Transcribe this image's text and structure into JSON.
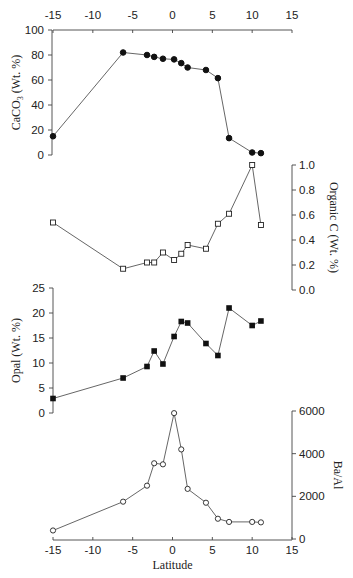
{
  "chart_data": [
    {
      "type": "line",
      "panel": "top",
      "title": "",
      "xlabel": "",
      "x_axis_position": "top",
      "xlim": [
        -15,
        15
      ],
      "x_ticks": [
        "-15",
        "-10",
        "-5",
        "0",
        "5",
        "10",
        "15"
      ],
      "ylabel": "CaCO3 (Wt. %)",
      "y_axis_side": "left",
      "ylim": [
        0,
        100
      ],
      "y_ticks": [
        "0",
        "20",
        "40",
        "60",
        "80",
        "100"
      ],
      "marker": "filled-circle",
      "x": [
        -15,
        -6.2,
        -3.2,
        -2.3,
        -1.2,
        0.2,
        1.1,
        1.9,
        4.2,
        5.7,
        7.1,
        10.0,
        11.1
      ],
      "values": [
        15,
        82,
        80,
        78.5,
        77,
        76.5,
        73.5,
        70,
        68,
        61.5,
        13.5,
        2,
        1.5
      ]
    },
    {
      "type": "line",
      "panel": "second",
      "ylabel": "Organic C (Wt. %)",
      "y_axis_side": "right",
      "ylim": [
        0.0,
        1.0
      ],
      "y_ticks": [
        "0.0",
        "0.2",
        "0.4",
        "0.6",
        "0.8",
        "1.0"
      ],
      "marker": "open-square",
      "x": [
        -15,
        -6.2,
        -3.2,
        -2.3,
        -1.2,
        0.2,
        1.1,
        1.9,
        4.2,
        5.7,
        7.1,
        10.0,
        11.1
      ],
      "values": [
        0.54,
        0.17,
        0.22,
        0.22,
        0.3,
        0.24,
        0.29,
        0.36,
        0.33,
        0.53,
        0.61,
        1.0,
        0.52
      ]
    },
    {
      "type": "line",
      "panel": "third",
      "ylabel": "Opal (Wt. %)",
      "y_axis_side": "left",
      "ylim": [
        0,
        25
      ],
      "y_ticks": [
        "0",
        "5",
        "10",
        "15",
        "20",
        "25"
      ],
      "marker": "filled-square",
      "x": [
        -15,
        -6.2,
        -3.2,
        -2.3,
        -1.2,
        0.2,
        1.1,
        1.9,
        4.2,
        5.7,
        7.1,
        10.0,
        11.1
      ],
      "values": [
        2.9,
        7.0,
        9.3,
        12.4,
        9.8,
        15.3,
        18.3,
        18.0,
        13.9,
        11.5,
        21.0,
        17.5,
        18.4
      ]
    },
    {
      "type": "line",
      "panel": "bottom",
      "xlabel": "Latitude",
      "x_axis_position": "bottom",
      "xlim": [
        -15,
        15
      ],
      "x_ticks": [
        "-15",
        "-10",
        "-5",
        "0",
        "5",
        "10",
        "15"
      ],
      "ylabel": "Ba/Al",
      "y_axis_side": "right",
      "ylim": [
        0,
        6000
      ],
      "y_ticks": [
        "0",
        "2000",
        "4000",
        "6000"
      ],
      "marker": "open-circle",
      "x": [
        -15,
        -6.2,
        -3.2,
        -2.3,
        -1.2,
        0.2,
        1.1,
        1.9,
        4.2,
        5.7,
        7.1,
        10.0,
        11.1
      ],
      "values": [
        400,
        1750,
        2500,
        3550,
        3500,
        5900,
        4200,
        2350,
        1700,
        950,
        800,
        800,
        780
      ]
    }
  ],
  "labels": {
    "caco3_axis_title": "CaCO3 (Wt. %)",
    "orgc_axis_title": "Organic C (Wt. %)",
    "opal_axis_title": "Opal (Wt. %)",
    "baal_axis_title": "Ba/Al",
    "latitude_axis_title": "Latitude"
  },
  "colors": {
    "axis": "#444444",
    "line": "#555555",
    "marker": "#111111",
    "text": "#222222"
  }
}
